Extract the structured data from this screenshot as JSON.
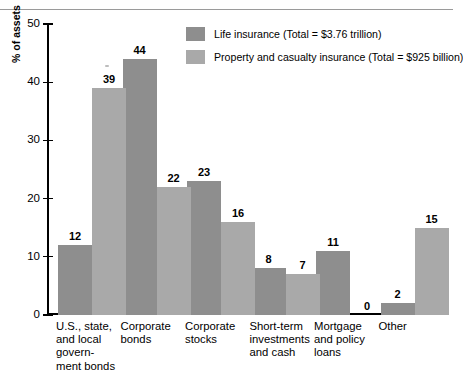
{
  "chart_data": {
    "type": "bar",
    "title": "",
    "xlabel": "",
    "ylabel": "% of assets",
    "ylim": [
      0,
      50
    ],
    "yticks": [
      "0",
      "10",
      "20",
      "30",
      "40",
      "50"
    ],
    "grid": false,
    "legend_position": "top-center-right",
    "categories": [
      "U.S., state, and local govern- ment bonds",
      "Corporate bonds",
      "Corporate stocks",
      "Short-term investments and cash",
      "Mortgage and policy loans",
      "Other"
    ],
    "category_lines": [
      [
        "U.S., state,",
        "and local",
        "govern-",
        "ment bonds"
      ],
      [
        "Corporate",
        "bonds"
      ],
      [
        "Corporate",
        "stocks"
      ],
      [
        "Short-term",
        "investments",
        "and cash"
      ],
      [
        "Mortgage",
        "and policy",
        "loans"
      ],
      [
        "Other"
      ]
    ],
    "series": [
      {
        "name": "Life insurance (Total = $3.76 trillion)",
        "color": "#8e8e8e",
        "values": [
          12,
          44,
          23,
          8,
          11,
          2
        ],
        "labels": [
          "12",
          "44",
          "23",
          "8",
          "11",
          "2"
        ]
      },
      {
        "name": "Property and casualty insurance (Total = $925 billion)",
        "color": "#a9a9a9",
        "values": [
          39,
          22,
          16,
          7,
          0,
          15
        ],
        "labels": [
          "39",
          "22",
          "16",
          "7",
          "0",
          "15"
        ]
      }
    ]
  },
  "axis": {
    "y_title": "% of assets"
  },
  "legend": {
    "entries": [
      {
        "label": "Life insurance (Total = $3.76 trillion)",
        "swatch": "s0"
      },
      {
        "label": "Property and casualty insurance (Total = $925 billion)",
        "swatch": "s1"
      }
    ]
  }
}
